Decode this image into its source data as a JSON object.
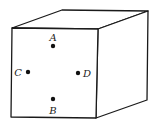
{
  "diagram": {
    "stroke_color": "#1a1a1a",
    "cube": {
      "front_face": [
        [
          12,
          28
        ],
        [
          98,
          29
        ],
        [
          96,
          118
        ],
        [
          11,
          117
        ]
      ],
      "top_face": [
        [
          12,
          28
        ],
        [
          62,
          10
        ],
        [
          148,
          11
        ],
        [
          98,
          29
        ]
      ],
      "right_face": [
        [
          98,
          29
        ],
        [
          148,
          11
        ],
        [
          147,
          100
        ],
        [
          96,
          118
        ]
      ]
    },
    "points": [
      {
        "label": "A",
        "x": 53,
        "y": 46,
        "lx": 53,
        "ly": 41
      },
      {
        "label": "B",
        "x": 53,
        "y": 99,
        "lx": 53,
        "ly": 114
      },
      {
        "label": "C",
        "x": 28,
        "y": 72,
        "lx": 18,
        "ly": 76
      },
      {
        "label": "D",
        "x": 78,
        "y": 73,
        "lx": 87,
        "ly": 77
      }
    ]
  }
}
